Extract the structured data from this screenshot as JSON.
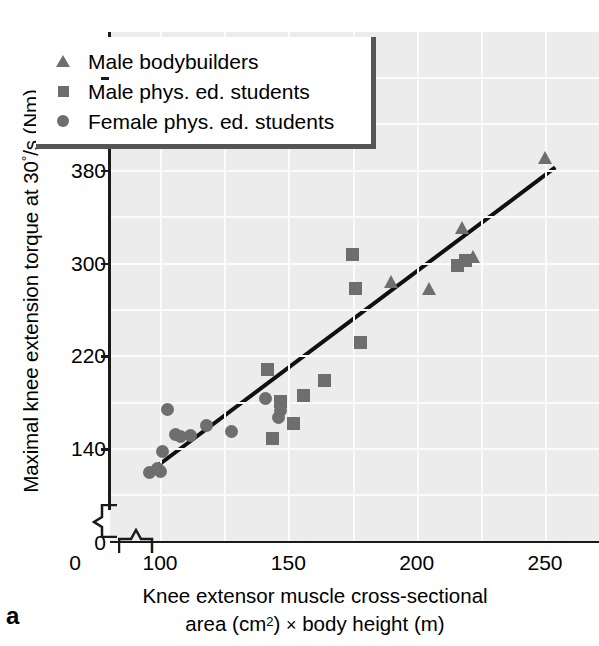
{
  "panel_label": "a",
  "axes": {
    "ylabel_prefix": "Maximal knee extension torque at 30",
    "ylabel_deg": "°",
    "ylabel_suffix": "/s (Nm)",
    "ylabel_full": "Maximal knee extension torque at 30°/s (Nm)",
    "xlabel_line1": "Knee extensor muscle cross-sectional",
    "xlabel_line2_a": "area (cm",
    "xlabel_line2_sup": "2",
    "xlabel_line2_b": ") ",
    "xlabel_times": "×",
    "xlabel_line2_c": " body height (m)",
    "xlabel_full": "Knee extensor muscle cross-sectional area (cm2) × body height (m)",
    "ytick_labels": [
      "460",
      "380",
      "300",
      "220",
      "140",
      "0"
    ],
    "xtick_labels": [
      "0",
      "100",
      "150",
      "200",
      "250"
    ]
  },
  "legend": {
    "items": [
      {
        "marker": "triangle-marker",
        "label": "Male bodybuilders"
      },
      {
        "marker": "square-marker",
        "label": "Male phys. ed. students"
      },
      {
        "marker": "circle-marker",
        "label": "Female phys. ed. students"
      }
    ]
  },
  "colors": {
    "marker": "#6e6e6e",
    "plot_background": "#ececec",
    "gridline": "#fbfbfb",
    "axis": "#1a1a1a",
    "legend_shadow": "#555555",
    "fit_line": "#101010"
  },
  "chart_data": {
    "type": "scatter",
    "title": "",
    "xlabel": "Knee extensor muscle cross-sectional area (cm2) × body height (m)",
    "ylabel": "Maximal knee extension torque at 30°/s (Nm)",
    "xlim": [
      90,
      262
    ],
    "ylim": [
      100,
      490
    ],
    "xticks": [
      0,
      100,
      150,
      200,
      250
    ],
    "yticks": [
      0,
      140,
      220,
      300,
      380,
      460
    ],
    "axis_break_x": true,
    "axis_break_y": true,
    "grid": true,
    "legend_position": "top-left",
    "series": [
      {
        "name": "Male bodybuilders",
        "marker": "triangle",
        "points": [
          [
            190,
            283
          ],
          [
            205,
            277
          ],
          [
            218,
            330
          ],
          [
            222,
            305
          ],
          [
            250,
            390
          ]
        ]
      },
      {
        "name": "Male phys. ed. students",
        "marker": "square",
        "points": [
          [
            142,
            208
          ],
          [
            144,
            148
          ],
          [
            147,
            180
          ],
          [
            152,
            161
          ],
          [
            156,
            185
          ],
          [
            164,
            198
          ],
          [
            175,
            307
          ],
          [
            176,
            278
          ],
          [
            178,
            231
          ],
          [
            216,
            297
          ],
          [
            219,
            302
          ]
        ]
      },
      {
        "name": "Female phys. ed. students",
        "marker": "circle",
        "points": [
          [
            96,
            119
          ],
          [
            99,
            122
          ],
          [
            100,
            120
          ],
          [
            101,
            137
          ],
          [
            103,
            173
          ],
          [
            106,
            152
          ],
          [
            108,
            150
          ],
          [
            112,
            151
          ],
          [
            118,
            159
          ],
          [
            128,
            154
          ],
          [
            141,
            183
          ],
          [
            146,
            166
          ],
          [
            147,
            172
          ]
        ]
      }
    ],
    "fit_line": {
      "name": "regression-line",
      "x_start": 95,
      "y_start": 118,
      "x_end": 254,
      "y_end": 382
    }
  }
}
